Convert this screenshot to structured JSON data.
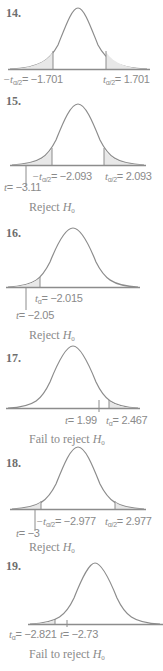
{
  "problems": [
    {
      "number": "14.",
      "labels": {
        "left_crit": "= −1.701",
        "right_crit": "= 1.701"
      },
      "conclusion": ""
    },
    {
      "number": "15.",
      "labels": {
        "left_crit": "= −2.093",
        "right_crit": "= 2.093",
        "t_stat": "= −3.11"
      },
      "conclusion": "Reject "
    },
    {
      "number": "16.",
      "labels": {
        "crit": "= −2.015",
        "t_stat": "= −2.05"
      },
      "conclusion": "Reject "
    },
    {
      "number": "17.",
      "labels": {
        "t_stat": "= 1.99",
        "crit": "= 2.467"
      },
      "conclusion": "Fail to reject "
    },
    {
      "number": "18.",
      "labels": {
        "left_crit": "= −2.977",
        "right_crit": "= 2.977",
        "t_stat": "= −3"
      },
      "conclusion": "Reject "
    },
    {
      "number": "19.",
      "labels": {
        "crit": "= −2.821",
        "t_stat": "= −2.73"
      },
      "conclusion": "Fail to reject "
    }
  ],
  "symbols": {
    "t": "t",
    "neg_t": "−t",
    "alpha_half": "α/2",
    "alpha": "α",
    "H": "H",
    "zero": "0"
  },
  "colors": {
    "curve": "#8c8c8c",
    "shade": "#e8e8e8",
    "text": "#8a8a8a"
  }
}
